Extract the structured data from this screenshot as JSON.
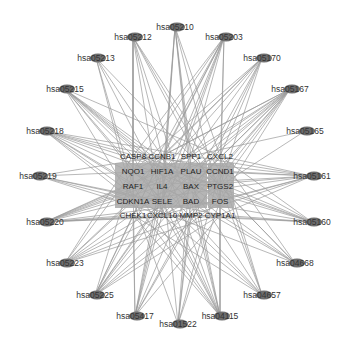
{
  "diagram": {
    "type": "network",
    "colors": {
      "background": "#ffffff",
      "edge": "#9a9a9a",
      "outer_node": "#6e6e6e",
      "inner_box": "#a8a8a8",
      "inner_box_dark": "#9c9c9c"
    },
    "pathway_nodes": [
      {
        "id": "hsa05210",
        "x": 175,
        "y": 27
      },
      {
        "id": "hsa05212",
        "x": 133,
        "y": 37
      },
      {
        "id": "hsa05203",
        "x": 224,
        "y": 37
      },
      {
        "id": "hsa05213",
        "x": 96,
        "y": 58
      },
      {
        "id": "hsa05170",
        "x": 262,
        "y": 58
      },
      {
        "id": "hsa05215",
        "x": 65,
        "y": 89
      },
      {
        "id": "hsa05167",
        "x": 290,
        "y": 89
      },
      {
        "id": "hsa05218",
        "x": 45,
        "y": 131
      },
      {
        "id": "hsa05165",
        "x": 305,
        "y": 131
      },
      {
        "id": "hsa05219",
        "x": 38,
        "y": 176
      },
      {
        "id": "hsa05161",
        "x": 312,
        "y": 176
      },
      {
        "id": "hsa05220",
        "x": 45,
        "y": 222
      },
      {
        "id": "hsa05160",
        "x": 312,
        "y": 222
      },
      {
        "id": "hsa05223",
        "x": 65,
        "y": 263
      },
      {
        "id": "hsa04668",
        "x": 295,
        "y": 263
      },
      {
        "id": "hsa05225",
        "x": 95,
        "y": 295
      },
      {
        "id": "hsa04657",
        "x": 262,
        "y": 295
      },
      {
        "id": "hsa05417",
        "x": 135,
        "y": 316
      },
      {
        "id": "hsa04115",
        "x": 220,
        "y": 316
      },
      {
        "id": "hsa01522",
        "x": 178,
        "y": 324
      }
    ],
    "gene_nodes": [
      {
        "id": "CASP8",
        "x": 133,
        "y": 156
      },
      {
        "id": "CCNB1",
        "x": 162,
        "y": 156
      },
      {
        "id": "SPP1",
        "x": 191,
        "y": 156
      },
      {
        "id": "CXCL2",
        "x": 220,
        "y": 156
      },
      {
        "id": "NQO1",
        "x": 133,
        "y": 171
      },
      {
        "id": "HIF1A",
        "x": 162,
        "y": 171
      },
      {
        "id": "PLAU",
        "x": 191,
        "y": 171
      },
      {
        "id": "CCND1",
        "x": 220,
        "y": 171
      },
      {
        "id": "RAF1",
        "x": 133,
        "y": 186
      },
      {
        "id": "IL4",
        "x": 162,
        "y": 186
      },
      {
        "id": "BAX",
        "x": 191,
        "y": 186
      },
      {
        "id": "PTGS2",
        "x": 220,
        "y": 186
      },
      {
        "id": "CDKN1A",
        "x": 133,
        "y": 201
      },
      {
        "id": "SELE",
        "x": 162,
        "y": 201
      },
      {
        "id": "BAD",
        "x": 191,
        "y": 201
      },
      {
        "id": "FOS",
        "x": 220,
        "y": 201
      },
      {
        "id": "CHEK1",
        "x": 133,
        "y": 215
      },
      {
        "id": "CXCL10",
        "x": 162,
        "y": 215
      },
      {
        "id": "MMP2",
        "x": 191,
        "y": 215
      },
      {
        "id": "CYP1A1",
        "x": 220,
        "y": 215
      }
    ],
    "boxed_genes": [
      "NQO1",
      "HIF1A",
      "PLAU",
      "CCND1",
      "RAF1",
      "IL4",
      "BAX",
      "PTGS2",
      "CDKN1A",
      "SELE",
      "BAD",
      "FOS"
    ]
  }
}
